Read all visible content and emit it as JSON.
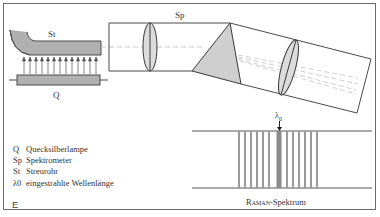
{
  "figure": {
    "corner_label": "E",
    "labels": {
      "streurohr": "St",
      "lampe": "Q",
      "spektrometer": "Sp",
      "lambda0": "λ",
      "lambda0_sub": "0"
    },
    "legend": [
      {
        "key": "Q",
        "text": "Quecksilberlampe"
      },
      {
        "key": "Sp",
        "text": "Spektrometer"
      },
      {
        "key": "St",
        "text": "Streurohr"
      },
      {
        "key": "λ0",
        "text": "eingestrahlte Wellenlänge"
      }
    ],
    "spectrum_caption": {
      "smallcaps_part": "Raman",
      "rest": "-Spektrum"
    },
    "spectrum": {
      "left_lines_x": [
        239,
        245,
        251,
        257,
        263,
        269
      ],
      "center_line_x": 279,
      "right_lines_x": [
        287,
        293,
        299,
        305,
        311,
        317
      ]
    },
    "colors": {
      "line": "#4a4a4a",
      "fill_gray": "#b8b8b8",
      "light_fill": "#d8d8d8",
      "spectrum_line": "#9a9a9a",
      "center_line": "#8a8a8a",
      "dashed": "#bbbbbb"
    }
  }
}
